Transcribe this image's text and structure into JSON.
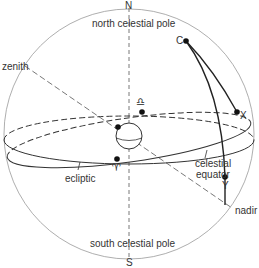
{
  "diagram": {
    "labels": {
      "north": "N",
      "south": "S",
      "north_pole": "north celestial pole",
      "south_pole": "south celestial pole",
      "zenith": "zenith",
      "nadir": "nadir",
      "ecliptic": "ecliptic",
      "equator_line1": "celestial",
      "equator_line2": "equator",
      "point_c": "C",
      "point_x": "X",
      "point_y": "Y",
      "vernal_equinox": "♈",
      "autumnal_equinox": "♎"
    },
    "colors": {
      "line": "#333333",
      "sphere": "#888888",
      "text": "#333333"
    }
  }
}
